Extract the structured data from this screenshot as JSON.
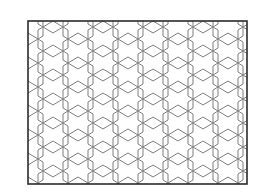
{
  "image": {
    "description": "Tessellation pattern of overlapping hexagon outlines inside a rectangular frame on a white background",
    "canvas": {
      "width": 256,
      "height": 195
    },
    "colors": {
      "background": "#ffffff",
      "frame_stroke": "#2b2b2b",
      "pattern_stroke": "#7f7f7f"
    }
  },
  "pattern": {
    "type": "overlapping-hexagons",
    "hex_width": 30,
    "hex_height": 36,
    "col_spacing": 25,
    "row_spacing": 24,
    "stagger": 12,
    "row_base": 51,
    "col_range": [
      -1,
      9
    ],
    "row_range": [
      -3,
      8
    ],
    "line_width": 1,
    "frame": {
      "x": 28,
      "y": 21,
      "width": 219,
      "height": 163,
      "line_width": 1.6
    }
  }
}
